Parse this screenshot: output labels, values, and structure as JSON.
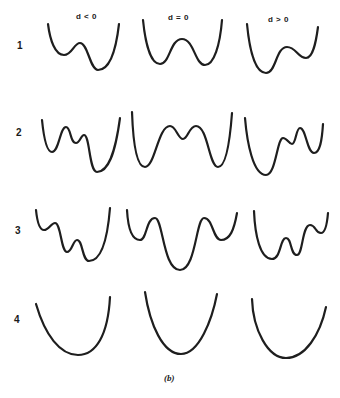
{
  "columns": [
    {
      "label": "d < 0"
    },
    {
      "label": "d = 0"
    },
    {
      "label": "d > 0"
    }
  ],
  "rows": [
    {
      "label": "1"
    },
    {
      "label": "2"
    },
    {
      "label": "3"
    },
    {
      "label": "4"
    }
  ],
  "caption": "(b)",
  "colors": {
    "stroke": "#1e1e1e",
    "background": "#ffffff"
  }
}
